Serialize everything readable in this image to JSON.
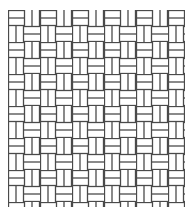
{
  "figure": {
    "type": "basketweave-pattern",
    "background": "#ffffff",
    "line_color": "#4a4a4a",
    "region": {
      "x": 8,
      "y": 10,
      "width": 177,
      "height": 197
    },
    "block_size": 16,
    "strips_per_block": 2
  }
}
